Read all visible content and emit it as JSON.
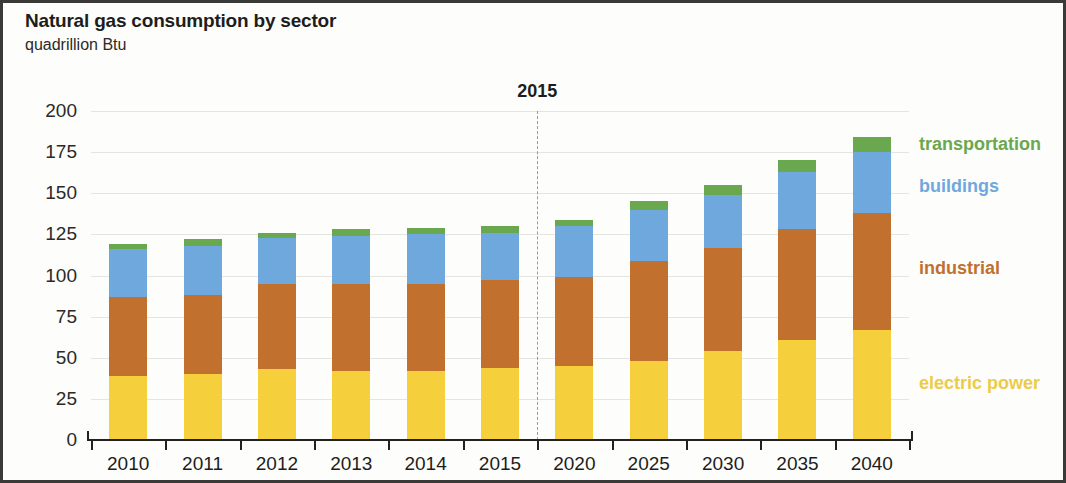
{
  "header": {
    "title": "Natural gas consumption by sector",
    "subtitle": "quadrillion Btu"
  },
  "annotation": {
    "projection_year_label": "2015"
  },
  "chart_data": {
    "type": "bar",
    "stacked": true,
    "title": "Natural gas consumption by sector",
    "subtitle": "quadrillion Btu",
    "xlabel": "",
    "ylabel": "quadrillion Btu",
    "ylim": [
      0,
      200
    ],
    "yticks": [
      0,
      25,
      50,
      75,
      100,
      125,
      150,
      175,
      200
    ],
    "ytick_labels": [
      "0",
      "25",
      "50",
      "75",
      "100",
      "125",
      "150",
      "175",
      "200"
    ],
    "grid": true,
    "legend_position": "right",
    "categories": [
      "2010",
      "2011",
      "2012",
      "2013",
      "2014",
      "2015",
      "2020",
      "2025",
      "2030",
      "2035",
      "2040"
    ],
    "series": [
      {
        "name": "electric power",
        "color": "#F5D03C",
        "values": [
          39,
          40,
          43,
          42,
          42,
          44,
          45,
          48,
          54,
          61,
          67
        ]
      },
      {
        "name": "industrial",
        "color": "#C1702E",
        "values": [
          48,
          48,
          52,
          53,
          53,
          53,
          54,
          61,
          63,
          67,
          71
        ]
      },
      {
        "name": "buildings",
        "color": "#6FA8DC",
        "values": [
          29,
          30,
          28,
          29,
          30,
          29,
          31,
          31,
          32,
          35,
          37
        ]
      },
      {
        "name": "transportation",
        "color": "#6AA84F",
        "values": [
          3,
          4,
          3,
          4,
          4,
          4,
          4,
          5,
          6,
          7,
          9
        ]
      }
    ],
    "totals": [
      119,
      122,
      126,
      128,
      129,
      130,
      134,
      145,
      155,
      170,
      184
    ],
    "annotations": [
      {
        "text": "2015",
        "type": "divider",
        "between": [
          "2015",
          "2020"
        ]
      }
    ]
  },
  "legend": [
    {
      "label": "transportation",
      "color": "#6AA84F"
    },
    {
      "label": "buildings",
      "color": "#6FA8DC"
    },
    {
      "label": "industrial",
      "color": "#C1702E"
    },
    {
      "label": "electric power",
      "color": "#EDCB48"
    }
  ]
}
